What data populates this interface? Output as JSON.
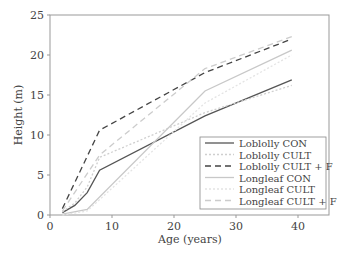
{
  "chart_data": {
    "type": "line",
    "title": "",
    "xlabel": "Age (years)",
    "ylabel": "Height (m)",
    "xlim": [
      0,
      45
    ],
    "ylim": [
      0,
      25
    ],
    "xticks": [
      0,
      10,
      20,
      30,
      40
    ],
    "yticks": [
      0,
      5,
      10,
      15,
      20,
      25
    ],
    "grid": false,
    "legend_position": "lower right",
    "series": [
      {
        "name": "Loblolly CON",
        "style": "solid",
        "color": "#555555",
        "x": [
          2,
          4,
          6,
          8,
          25,
          39
        ],
        "y": [
          0.3,
          1.2,
          2.8,
          5.6,
          12.4,
          16.9
        ]
      },
      {
        "name": "Loblolly CULT",
        "style": "dotted",
        "color": "#cfcfcf",
        "x": [
          2,
          4,
          6,
          8,
          25,
          39
        ],
        "y": [
          0.4,
          1.5,
          3.5,
          7.2,
          12.8,
          16.2
        ]
      },
      {
        "name": "Loblolly CULT + F",
        "style": "dashed",
        "color": "#444444",
        "x": [
          2,
          8,
          25,
          39
        ],
        "y": [
          0.8,
          10.6,
          17.8,
          22.0
        ]
      },
      {
        "name": "Longleaf CON",
        "style": "solid",
        "color": "#c8c8c8",
        "x": [
          2,
          6,
          25,
          39
        ],
        "y": [
          0.1,
          0.7,
          15.5,
          20.6
        ]
      },
      {
        "name": "Longleaf CULT",
        "style": "dotted",
        "color": "#e4e4e4",
        "x": [
          2,
          6,
          25,
          39
        ],
        "y": [
          0.0,
          0.5,
          14.0,
          20.0
        ]
      },
      {
        "name": "Longleaf CULT + F",
        "style": "dashed",
        "color": "#cccccc",
        "x": [
          2,
          8,
          25,
          39
        ],
        "y": [
          0.5,
          7.5,
          18.3,
          22.3
        ]
      }
    ]
  }
}
